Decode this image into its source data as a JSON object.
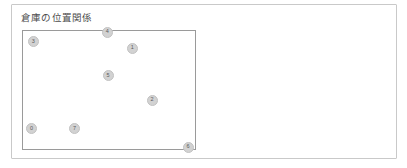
{
  "panel": {
    "title": "倉庫の位置関係",
    "border_color": "#c9c9c9",
    "background": "#ffffff"
  },
  "plot": {
    "frame_color": "#9a9a9a",
    "background": "#ffffff",
    "marker_fill": "#d2d2d2",
    "marker_text_color": "#5a5a5a"
  },
  "chart_data": {
    "type": "scatter",
    "title": "倉庫の位置関係",
    "xlabel": "",
    "ylabel": "",
    "xlim": [
      0,
      100
    ],
    "ylim": [
      0,
      100
    ],
    "grid": false,
    "legend": null,
    "axis_ticks_visible": false,
    "point_labels": [
      "0",
      "1",
      "2",
      "3",
      "4",
      "5",
      "6",
      "7"
    ],
    "points": [
      {
        "label": "3",
        "x": 6.0,
        "y": 91.0
      },
      {
        "label": "4",
        "x": 49.0,
        "y": 99.0
      },
      {
        "label": "1",
        "x": 63.5,
        "y": 85.5
      },
      {
        "label": "5",
        "x": 49.5,
        "y": 62.5
      },
      {
        "label": "2",
        "x": 75.0,
        "y": 41.5
      },
      {
        "label": "0",
        "x": 5.0,
        "y": 17.0
      },
      {
        "label": "7",
        "x": 30.0,
        "y": 17.0
      },
      {
        "label": "6",
        "x": 96.0,
        "y": 1.5
      }
    ]
  }
}
